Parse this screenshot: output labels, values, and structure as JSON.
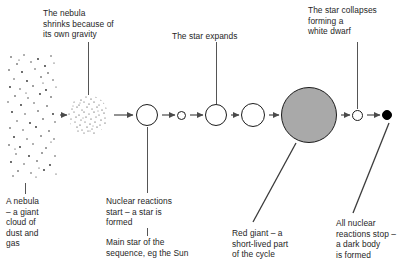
{
  "diagram": {
    "top_labels": [
      {
        "id": "nebula-shrinks",
        "text": "The nebula\nshrinks because of\nits own gravity",
        "x": 43,
        "y": 8
      },
      {
        "id": "star-expands",
        "text": "The star expands",
        "x": 172,
        "y": 31
      },
      {
        "id": "star-collapses",
        "text": "The star collapses\nforming a\nwhite dwarf",
        "x": 308,
        "y": 5
      }
    ],
    "bottom_labels": [
      {
        "id": "nebula",
        "text": "A nebula\n– a giant\ncloud of\ndust and\ngas",
        "x": 6,
        "y": 196
      },
      {
        "id": "nuclear-start",
        "text": "Nuclear reactions\nstart – a star is\nformed",
        "x": 106,
        "y": 196
      },
      {
        "id": "main-sequence",
        "text": "Main star of the\nsequence, eg the Sun",
        "x": 106,
        "y": 237
      },
      {
        "id": "red-giant",
        "text": "Red giant – a\nshort-lived part\nof the cycle",
        "x": 232,
        "y": 228
      },
      {
        "id": "dark-body",
        "text": "All nuclear\nreactions stop –\na dark body\nis formed",
        "x": 336,
        "y": 218
      }
    ],
    "stages": [
      {
        "id": "nebula-cloud",
        "kind": "speckled-rectangle",
        "label": "A nebula – a giant cloud of dust and gas",
        "cx": 32,
        "cy": 115,
        "width": 50,
        "height": 125
      },
      {
        "id": "shrinking-nebula",
        "kind": "speckled-circle",
        "label": "The nebula shrinks because of its own gravity",
        "cx": 88,
        "cy": 115,
        "diameter": 39
      },
      {
        "id": "protostar",
        "kind": "outline-circle",
        "label": "Nuclear reactions start – a star is formed",
        "cx": 147,
        "cy": 115,
        "diameter": 22
      },
      {
        "id": "small-star",
        "kind": "outline-circle",
        "label": "small star",
        "cx": 181,
        "cy": 115,
        "diameter": 9
      },
      {
        "id": "main-sequence-star",
        "kind": "outline-circle",
        "label": "Main star of the sequence, eg the Sun",
        "cx": 216,
        "cy": 115,
        "diameter": 22
      },
      {
        "id": "expanding-star",
        "kind": "outline-circle",
        "label": "The star expands",
        "cx": 253,
        "cy": 115,
        "diameter": 24
      },
      {
        "id": "red-giant-star",
        "kind": "gray-filled-circle",
        "label": "Red giant – a short-lived part of the cycle",
        "cx": 309,
        "cy": 115,
        "diameter": 56
      },
      {
        "id": "white-dwarf",
        "kind": "outline-circle",
        "label": "The star collapses forming a white dwarf",
        "cx": 357,
        "cy": 115,
        "diameter": 11
      },
      {
        "id": "dark-body-star",
        "kind": "black-filled-circle",
        "label": "All nuclear reactions stop – a dark body is formed",
        "cx": 387,
        "cy": 115,
        "diameter": 10
      }
    ],
    "arrows": [
      {
        "id": "arrow-1",
        "from": "nebula-cloud",
        "to": "shrinking-nebula",
        "x1": 56,
        "x2": 67,
        "y": 115
      },
      {
        "id": "arrow-2",
        "from": "shrinking-nebula",
        "to": "protostar",
        "x1": 110,
        "x2": 134,
        "y": 115
      },
      {
        "id": "arrow-3",
        "from": "protostar",
        "to": "small-star",
        "x1": 160,
        "x2": 175,
        "y": 115
      },
      {
        "id": "arrow-4",
        "from": "small-star",
        "to": "main-sequence-star",
        "x1": 187,
        "x2": 203,
        "y": 115
      },
      {
        "id": "arrow-5",
        "from": "main-sequence-star",
        "to": "expanding-star",
        "x1": 229,
        "x2": 240,
        "y": 115
      },
      {
        "id": "arrow-6",
        "from": "expanding-star",
        "to": "red-giant-star",
        "x1": 267,
        "x2": 280,
        "y": 115
      },
      {
        "id": "arrow-7",
        "from": "red-giant-star",
        "to": "white-dwarf",
        "x1": 339,
        "x2": 350,
        "y": 115
      },
      {
        "id": "arrow-8",
        "from": "white-dwarf",
        "to": "dark-body-star",
        "x1": 365,
        "x2": 380,
        "y": 115
      }
    ],
    "leaders": [
      {
        "id": "leader-nebula-shrinks",
        "type": "vertical",
        "x": 88,
        "y1": 42,
        "y2": 95
      },
      {
        "id": "leader-star-expands",
        "type": "vertical",
        "x": 216,
        "y1": 42,
        "y2": 104
      },
      {
        "id": "leader-star-collapses",
        "type": "vertical",
        "x": 357,
        "y1": 42,
        "y2": 109
      },
      {
        "id": "leader-nebula-label",
        "type": "vertical",
        "x": 25,
        "y1": 183,
        "y2": 194
      },
      {
        "id": "leader-nuclear-start",
        "type": "vertical",
        "x": 147,
        "y1": 127,
        "y2": 193
      },
      {
        "id": "leader-main-sequence",
        "type": "vertical",
        "x": 147,
        "y1": 228,
        "y2": 236
      },
      {
        "id": "leader-red-giant",
        "type": "diagonal",
        "x1": 296,
        "y1": 143,
        "x2": 253,
        "y2": 222
      },
      {
        "id": "leader-dark-body",
        "type": "diagonal",
        "x1": 389,
        "y1": 123,
        "x2": 353,
        "y2": 213
      }
    ]
  }
}
